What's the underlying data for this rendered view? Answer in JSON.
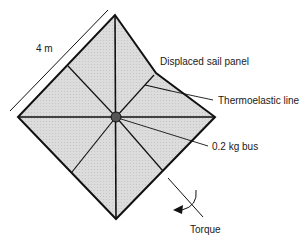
{
  "figure": {
    "type": "solar sail schematic",
    "labels": {
      "dimension": "4 m",
      "displaced_panel": "Displaced sail panel",
      "thermoelastic_line": "Thermoelastic line",
      "bus": "0.2 kg bus",
      "torque": "Torque"
    },
    "colors": {
      "sail_fill": "#d9d9d9",
      "stroke": "#111111",
      "text": "#1a1a1a"
    }
  }
}
